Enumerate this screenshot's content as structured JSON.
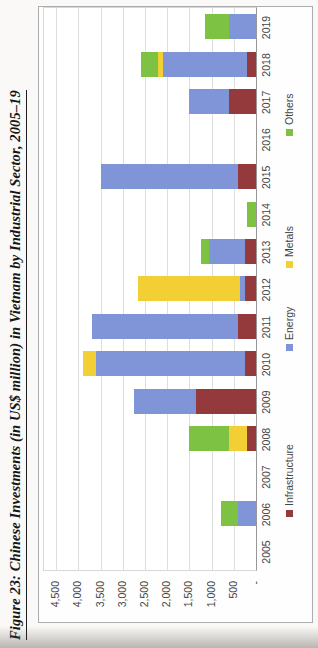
{
  "figure": {
    "title": "Figure 23: Chinese Investments (in US$ million) in Vietnam by Industrial Sector, 2005–19"
  },
  "chart_data": {
    "type": "bar",
    "stacked": true,
    "rotation": "landscape chart rotated 90 degrees counterclockwise on page",
    "title": "Figure 23: Chinese Investments (in US$ million) in Vietnam by Industrial Sector, 2005–19",
    "categories": [
      "2005",
      "2006",
      "2007",
      "2008",
      "2009",
      "2010",
      "2011",
      "2012",
      "2013",
      "2014",
      "2015",
      "2016",
      "2017",
      "2018",
      "2019"
    ],
    "series": [
      {
        "name": "Infrastructure",
        "color": "#943A3C",
        "values": [
          0,
          0,
          0,
          200,
          1350,
          250,
          400,
          250,
          250,
          0,
          400,
          0,
          600,
          200,
          0
        ]
      },
      {
        "name": "Energy",
        "color": "#8095D8",
        "values": [
          0,
          400,
          0,
          0,
          1400,
          3350,
          3300,
          100,
          800,
          0,
          3100,
          0,
          900,
          1900,
          600
        ]
      },
      {
        "name": "Metals",
        "color": "#F2CF35",
        "values": [
          0,
          0,
          0,
          400,
          0,
          300,
          0,
          2300,
          0,
          0,
          0,
          0,
          0,
          100,
          0
        ]
      },
      {
        "name": "Others",
        "color": "#7DC243",
        "values": [
          0,
          400,
          0,
          900,
          0,
          0,
          0,
          0,
          200,
          200,
          0,
          0,
          0,
          400,
          550
        ]
      }
    ],
    "xlabel": "",
    "ylabel": "",
    "ylim": [
      0,
      4500
    ],
    "ytick_interval": 500,
    "ytick_labels": [
      "4,500",
      "4,000",
      "3,500",
      "3,000",
      "2,500",
      "2,000",
      "1,500",
      "1,000",
      "500",
      "-"
    ],
    "grid": true,
    "legend_position": "bottom"
  }
}
